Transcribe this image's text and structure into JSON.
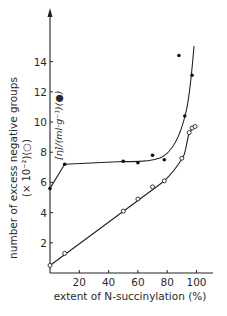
{
  "chart_data": {
    "type": "scatter",
    "title": "",
    "xlabel": "extent of N-succinylation (%)",
    "ylabel": "number of excess negative groups",
    "ylabel_line2": "(× 10⁻²)(○)",
    "inner_label": "[η]/(ml·g⁻¹)(●)",
    "x_ticks": [
      "20",
      "40",
      "60",
      "80",
      "100"
    ],
    "y_ticks": [
      "2",
      "4",
      "6",
      "8",
      "10",
      "12",
      "14"
    ],
    "xlim": [
      0,
      110
    ],
    "ylim": [
      0,
      16
    ],
    "grid": false,
    "series": [
      {
        "name": "number of excess negative groups (×10⁻²) (○)",
        "marker": "open-circle",
        "x": [
          0,
          10,
          50,
          60,
          70,
          78,
          90,
          95,
          97,
          99
        ],
        "y": [
          0.5,
          1.3,
          4.1,
          4.9,
          5.7,
          6.1,
          7.6,
          9.3,
          9.6,
          9.7
        ]
      },
      {
        "name": "[η]/(ml·g⁻¹) (●)",
        "marker": "filled-circle",
        "x": [
          0,
          10,
          50,
          60,
          70,
          78,
          88,
          92,
          97
        ],
        "y": [
          5.6,
          7.2,
          7.4,
          7.3,
          7.8,
          7.5,
          14.4,
          10.4,
          13.1
        ]
      }
    ]
  }
}
